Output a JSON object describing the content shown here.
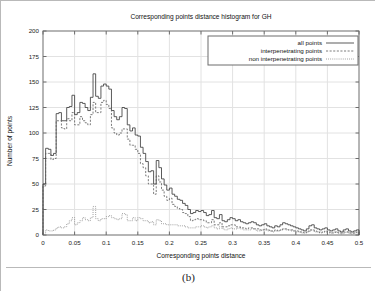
{
  "figure": {
    "caption": "(b)"
  },
  "chart_data": {
    "type": "line",
    "title": "Corresponding points distance histogram for GH",
    "xlabel": "Corresponding points distance",
    "ylabel": "Number of points",
    "xlim": [
      0,
      0.5
    ],
    "ylim": [
      0,
      200
    ],
    "xticks": [
      0,
      0.05,
      0.1,
      0.15,
      0.2,
      0.25,
      0.3,
      0.35,
      0.4,
      0.45,
      0.5
    ],
    "xticklabels": [
      "0",
      "0.05",
      "0.1",
      "0.15",
      "0.2",
      "0.25",
      "0.3",
      "0.35",
      "0.4",
      "0.45",
      "0.5"
    ],
    "yticks": [
      0,
      25,
      50,
      75,
      100,
      125,
      150,
      175,
      200
    ],
    "yticklabels": [
      "0",
      "25",
      "50",
      "75",
      "100",
      "125",
      "150",
      "175",
      "200"
    ],
    "grid": true,
    "legend_position": "upper right",
    "bin_width": 0.0041667,
    "x_start": 0.0,
    "series": [
      {
        "name": "all points",
        "style": "solid",
        "values": [
          50,
          85,
          84,
          78,
          80,
          119,
          120,
          112,
          112,
          125,
          126,
          137,
          118,
          120,
          130,
          129,
          125,
          122,
          135,
          158,
          136,
          134,
          146,
          148,
          146,
          143,
          122,
          116,
          113,
          116,
          125,
          124,
          108,
          102,
          105,
          98,
          97,
          86,
          80,
          72,
          62,
          63,
          50,
          73,
          66,
          55,
          49,
          44,
          46,
          40,
          38,
          35,
          34,
          31,
          29,
          25,
          21,
          22,
          24,
          23,
          24,
          22,
          19,
          20,
          24,
          17,
          16,
          20,
          14,
          13,
          15,
          17,
          16,
          14,
          15,
          13,
          12,
          11,
          12,
          13,
          12,
          10,
          9,
          10,
          11,
          9,
          8,
          7,
          9,
          8,
          10,
          12,
          11,
          10,
          9,
          8,
          7,
          6,
          5,
          4,
          6,
          9,
          10,
          7,
          6,
          5,
          6,
          7,
          5,
          4,
          5,
          6,
          4,
          3,
          5,
          6,
          4,
          3,
          4,
          5
        ]
      },
      {
        "name": "interpenetrating points",
        "style": "dashed",
        "values": [
          48,
          80,
          80,
          74,
          75,
          112,
          112,
          105,
          104,
          114,
          112,
          120,
          108,
          108,
          116,
          112,
          110,
          108,
          118,
          130,
          120,
          120,
          130,
          132,
          128,
          124,
          105,
          100,
          98,
          100,
          104,
          104,
          94,
          88,
          88,
          84,
          80,
          70,
          66,
          58,
          50,
          50,
          40,
          58,
          52,
          44,
          38,
          34,
          36,
          30,
          28,
          26,
          25,
          22,
          21,
          18,
          14,
          15,
          16,
          15,
          15,
          14,
          12,
          12,
          15,
          10,
          10,
          12,
          8,
          8,
          9,
          10,
          10,
          8,
          8,
          7,
          7,
          6,
          7,
          7,
          6,
          6,
          5,
          5,
          6,
          5,
          4,
          4,
          5,
          4,
          5,
          6,
          6,
          5,
          5,
          4,
          4,
          3,
          3,
          2,
          3,
          5,
          5,
          4,
          3,
          2,
          3,
          4,
          3,
          2,
          2,
          3,
          2,
          2,
          3,
          3,
          2,
          2,
          2,
          3
        ]
      },
      {
        "name": "non interpenetrating points",
        "style": "dotted",
        "values": [
          2,
          5,
          4,
          4,
          5,
          7,
          8,
          7,
          8,
          11,
          14,
          17,
          10,
          12,
          14,
          17,
          15,
          14,
          17,
          28,
          16,
          14,
          16,
          16,
          18,
          19,
          17,
          16,
          15,
          16,
          21,
          20,
          14,
          14,
          17,
          14,
          17,
          16,
          14,
          14,
          12,
          13,
          10,
          15,
          14,
          11,
          11,
          10,
          10,
          10,
          10,
          9,
          9,
          9,
          8,
          7,
          7,
          7,
          8,
          8,
          9,
          8,
          7,
          8,
          9,
          7,
          6,
          8,
          6,
          5,
          6,
          7,
          6,
          6,
          7,
          6,
          5,
          5,
          5,
          6,
          6,
          4,
          4,
          5,
          5,
          4,
          4,
          3,
          4,
          4,
          5,
          6,
          5,
          5,
          4,
          4,
          3,
          3,
          2,
          2,
          3,
          4,
          5,
          3,
          3,
          3,
          3,
          3,
          2,
          2,
          3,
          3,
          2,
          1,
          2,
          3,
          2,
          1,
          2,
          2
        ]
      }
    ]
  }
}
